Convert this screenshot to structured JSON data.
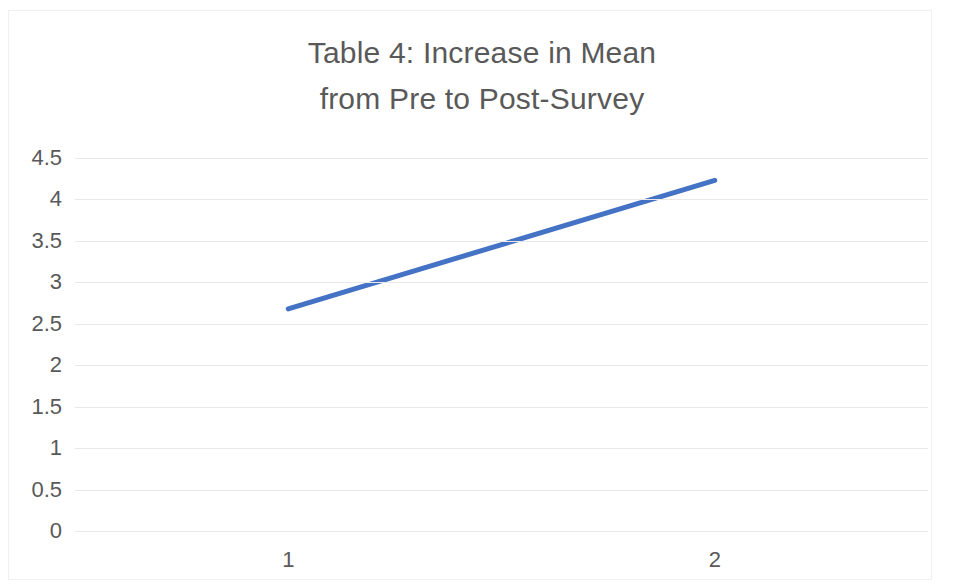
{
  "chart_data": {
    "type": "line",
    "title": "Table 4: Increase in Mean\nfrom Pre to Post-Survey",
    "title_line1": "Table 4: Increase in Mean",
    "title_line2": "from Pre to Post-Survey",
    "xlabel": "",
    "ylabel": "",
    "categories": [
      "1",
      "2"
    ],
    "values": [
      2.68,
      4.23
    ],
    "series": [
      {
        "name": "Mean",
        "values": [
          2.68,
          4.23
        ],
        "color": "#4472C4"
      }
    ],
    "ylim": [
      0,
      4.5
    ],
    "ytick_step": 0.5,
    "ytick_labels": [
      "4.5",
      "4",
      "3.5",
      "3",
      "2.5",
      "2",
      "1.5",
      "1",
      "0.5",
      "0"
    ],
    "ytick_values": [
      4.5,
      4,
      3.5,
      3,
      2.5,
      2,
      1.5,
      1,
      0.5,
      0
    ],
    "grid": true,
    "grid_color": "#e8e8e8",
    "legend": false,
    "legend_position": "none",
    "markers": false,
    "line_width_px": 5,
    "annotations": [],
    "colors": {
      "series_blue": "#4472C4",
      "text": "#595959",
      "gridline": "#e8e8e8",
      "border": "#f0f0f0",
      "background": "#ffffff"
    }
  }
}
